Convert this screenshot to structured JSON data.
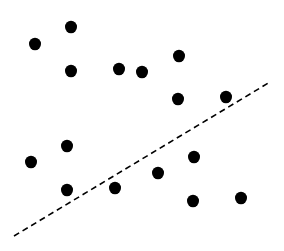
{
  "chart_data": {
    "type": "scatter",
    "title": "",
    "xlabel": "",
    "ylabel": "",
    "grid": false,
    "legend": null,
    "point_color": "#000000",
    "point_radius": 6,
    "points": [
      {
        "x": 35,
        "y": 44
      },
      {
        "x": 71,
        "y": 27
      },
      {
        "x": 71,
        "y": 71
      },
      {
        "x": 119,
        "y": 69
      },
      {
        "x": 142,
        "y": 72
      },
      {
        "x": 179,
        "y": 56
      },
      {
        "x": 178,
        "y": 99
      },
      {
        "x": 226,
        "y": 97
      },
      {
        "x": 67,
        "y": 146
      },
      {
        "x": 31,
        "y": 162
      },
      {
        "x": 67,
        "y": 190
      },
      {
        "x": 115,
        "y": 188
      },
      {
        "x": 194,
        "y": 157
      },
      {
        "x": 158,
        "y": 173
      },
      {
        "x": 193,
        "y": 201
      },
      {
        "x": 241,
        "y": 198
      }
    ],
    "separator_line": {
      "style": "dashed",
      "color": "#000000",
      "x1": 14,
      "y1": 236,
      "x2": 270,
      "y2": 82,
      "dash": "6 4"
    }
  }
}
